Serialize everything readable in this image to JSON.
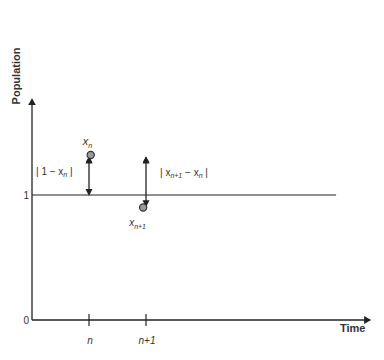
{
  "chart_data": {
    "type": "diagram",
    "title": "",
    "xlabel": "Time",
    "ylabel": "Population",
    "y_ticks": [
      {
        "value": 0,
        "label": "0"
      },
      {
        "value": 1,
        "label": "1"
      }
    ],
    "x_ticks": [
      {
        "value": 1,
        "label": "n"
      },
      {
        "value": 2,
        "label": "n+1"
      }
    ],
    "xlim": [
      0,
      5.3
    ],
    "ylim": [
      0,
      1.75
    ],
    "reference_line": {
      "y": 1
    },
    "points": [
      {
        "name": "x_n",
        "x": 1.03,
        "y": 1.32,
        "label": "x",
        "sub": "n"
      },
      {
        "name": "x_n+1",
        "x": 1.95,
        "y": 0.9,
        "label": "x",
        "sub": "n+1"
      }
    ],
    "annotations": [
      {
        "name": "distance-1-xn",
        "x": 1,
        "y_from": 1.0,
        "y_to": 1.3,
        "text_pre": "| 1 − x",
        "sub": "n",
        "text_post": " |"
      },
      {
        "name": "distance-xn1-xn",
        "x": 2,
        "y_from": 0.91,
        "y_to": 1.3,
        "text_pre": "| x",
        "sub": "n+1",
        "text_mid": " − x",
        "sub2": "n",
        "text_post": " |"
      }
    ]
  }
}
